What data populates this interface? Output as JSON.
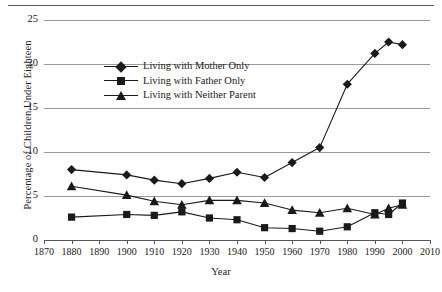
{
  "chart_data": {
    "type": "line",
    "title": "",
    "xlabel": "Year",
    "ylabel": "Percentage of Children Under Eighteen",
    "xlim": [
      1870,
      2010
    ],
    "ylim": [
      0,
      25
    ],
    "xticks": [
      1870,
      1880,
      1890,
      1900,
      1910,
      1920,
      1930,
      1940,
      1950,
      1960,
      1970,
      1980,
      1990,
      2000,
      2010
    ],
    "yticks": [
      0,
      5,
      10,
      15,
      20,
      25
    ],
    "grid": true,
    "legend_position": "upper-left-inside",
    "series": [
      {
        "name": "Living with Mother Only",
        "marker": "diamond",
        "color": "#1a1a1a",
        "x": [
          1880,
          1900,
          1910,
          1920,
          1930,
          1940,
          1950,
          1960,
          1970,
          1980,
          1990,
          1995,
          2000
        ],
        "values": [
          8.0,
          7.4,
          6.8,
          6.4,
          7.0,
          7.7,
          7.1,
          8.8,
          10.5,
          17.7,
          21.2,
          22.5,
          22.2
        ]
      },
      {
        "name": "Living with Father Only",
        "marker": "square",
        "color": "#1a1a1a",
        "x": [
          1880,
          1900,
          1910,
          1920,
          1930,
          1940,
          1950,
          1960,
          1970,
          1980,
          1990,
          1995,
          2000
        ],
        "values": [
          2.6,
          2.9,
          2.8,
          3.2,
          2.5,
          2.3,
          1.4,
          1.3,
          1.0,
          1.5,
          3.1,
          2.9,
          4.2
        ]
      },
      {
        "name": "Living with Neither Parent",
        "marker": "triangle",
        "color": "#1a1a1a",
        "x": [
          1880,
          1900,
          1910,
          1920,
          1930,
          1940,
          1950,
          1960,
          1970,
          1980,
          1990,
          1995,
          2000
        ],
        "values": [
          6.1,
          5.1,
          4.4,
          4.0,
          4.5,
          4.5,
          4.2,
          3.4,
          3.1,
          3.6,
          2.9,
          3.6,
          4.0
        ]
      }
    ]
  },
  "axes": {
    "y_title": "Percentage of Children Under Eighteen",
    "x_title": "Year",
    "y_tick_labels": [
      "0",
      "5",
      "10",
      "15",
      "20",
      "25"
    ],
    "x_tick_labels": [
      "1870",
      "1880",
      "1890",
      "1900",
      "1910",
      "1920",
      "1930",
      "1940",
      "1950",
      "1960",
      "1970",
      "1980",
      "1990",
      "2000",
      "2010"
    ]
  },
  "legend": {
    "items": [
      {
        "label": "Living with Mother Only",
        "marker": "diamond-marker-icon"
      },
      {
        "label": "Living with Father Only",
        "marker": "square-marker-icon"
      },
      {
        "label": "Living with Neither Parent",
        "marker": "triangle-marker-icon"
      }
    ]
  },
  "style": {
    "ink": "#1a1a1a",
    "gridline": "#9a9a9e",
    "axis": "#55565a",
    "background": "#ffffff"
  }
}
